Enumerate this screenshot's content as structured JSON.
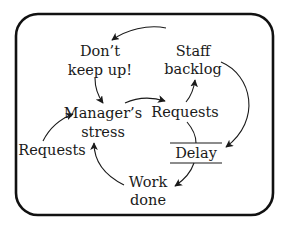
{
  "diagram": {
    "type": "causal-loop",
    "nodes": {
      "dont_keep_up": {
        "line1": "Don’t",
        "line2": "keep up!"
      },
      "staff_backlog": {
        "line1": "Staff",
        "line2": "backlog"
      },
      "managers_stress": {
        "line1": "Manager’s",
        "line2": "stress"
      },
      "requests_right": {
        "label": "Requests"
      },
      "requests_left": {
        "label": "Requests"
      },
      "delay": {
        "label": "Delay"
      },
      "work_done": {
        "line1": "Work",
        "line2": "done"
      }
    },
    "edges": [
      {
        "from": "Staff backlog",
        "to": "Don’t keep up!"
      },
      {
        "from": "Don’t keep up!",
        "to": "Manager’s stress"
      },
      {
        "from": "Manager’s stress",
        "to": "Requests"
      },
      {
        "from": "Requests",
        "to": "Staff backlog"
      },
      {
        "from": "Staff backlog",
        "to": "Delay"
      },
      {
        "from": "Requests",
        "to": "Delay"
      },
      {
        "from": "Delay",
        "to": "Work done"
      },
      {
        "from": "Work done",
        "to": "Manager’s stress"
      },
      {
        "from": "Requests (left)",
        "to": "Manager’s stress"
      }
    ],
    "colors": {
      "stroke": "#111111",
      "background": "#ffffff"
    }
  }
}
